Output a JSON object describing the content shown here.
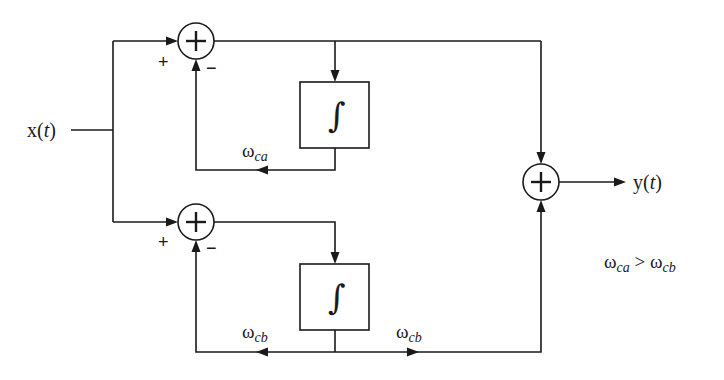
{
  "diagram": {
    "type": "block-diagram",
    "input": {
      "label_main": "x(",
      "label_var": "t",
      "label_close": ")"
    },
    "output": {
      "label_main": "y(",
      "label_var": "t",
      "label_close": ")"
    },
    "branches": [
      {
        "id": "a",
        "summer": {
          "plus_sign": "+",
          "minus_sign": "−"
        },
        "integrator": {
          "symbol": "∫"
        },
        "feedback_gain": {
          "symbol": "ω",
          "subscript": "ca"
        }
      },
      {
        "id": "b",
        "summer": {
          "plus_sign": "+",
          "minus_sign": "−"
        },
        "integrator": {
          "symbol": "∫"
        },
        "feedback_gain": {
          "symbol": "ω",
          "subscript": "cb"
        },
        "forward_gain": {
          "symbol": "ω",
          "subscript": "cb"
        }
      }
    ],
    "output_summer": {
      "symbol": "+"
    },
    "annotation": {
      "lhs_symbol": "ω",
      "lhs_subscript": "ca",
      "operator": " > ",
      "rhs_symbol": "ω",
      "rhs_subscript": "cb"
    },
    "colors": {
      "ink": "#1a1a1a",
      "background": "#ffffff"
    }
  }
}
